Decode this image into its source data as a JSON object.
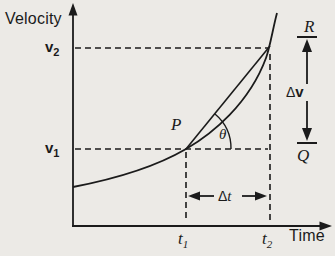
{
  "figure": {
    "background_color": "#eceae6",
    "ink_color": "#1b1b1b"
  },
  "axes": {
    "y_axis_label": "Velocity",
    "x_axis_label": "Time"
  },
  "labels": {
    "v2": {
      "base": "v",
      "sub": "2"
    },
    "v1": {
      "base": "v",
      "sub": "1"
    },
    "t1": {
      "base": "t",
      "sub": "1"
    },
    "t2": {
      "base": "t",
      "sub": "2"
    },
    "point_p": "P",
    "angle_theta": "θ",
    "delta_t": {
      "delta": "Δ",
      "var": "t"
    },
    "delta_v": {
      "delta": "Δ",
      "var": "v"
    },
    "point_r": "R",
    "point_q": "Q"
  }
}
